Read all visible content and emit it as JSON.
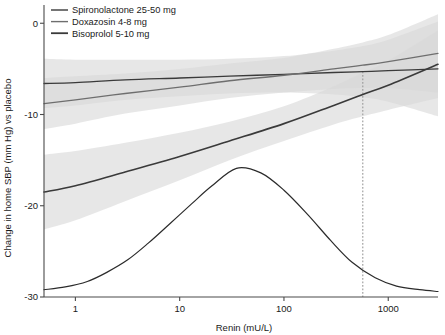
{
  "chart_data": {
    "type": "line",
    "title": "",
    "xlabel": "Renin (mU/L)",
    "ylabel": "Change in home SBP (mm Hg) vs placebo",
    "xscale": "log",
    "xlim": [
      0.5,
      3000
    ],
    "ylim": [
      -30,
      2
    ],
    "xticks": [
      1,
      10,
      100,
      1000
    ],
    "xticklabels": [
      "1",
      "10",
      "100",
      "1000"
    ],
    "yticks": [
      0,
      -10,
      -20,
      -30
    ],
    "yticklabels": [
      "0",
      "-10",
      "-20",
      "-30"
    ],
    "grid": false,
    "legend_position": "top-left",
    "series": [
      {
        "name": "Spironolactone 25-50 mg",
        "color": "#3a3a3a",
        "linewidth": 1.3,
        "x": [
          0.5,
          1,
          3,
          10,
          30,
          100,
          300,
          570,
          1000,
          3000
        ],
        "y": [
          -6.6,
          -6.5,
          -6.2,
          -6.0,
          -5.8,
          -5.6,
          -5.4,
          -5.3,
          -5.2,
          -5.0
        ],
        "band_lower": [
          -9.3,
          -9.0,
          -8.4,
          -8.0,
          -7.7,
          -7.6,
          -7.8,
          -8.1,
          -8.6,
          -10.2
        ],
        "band_upper": [
          -3.9,
          -4.0,
          -4.0,
          -4.0,
          -3.9,
          -3.6,
          -3.0,
          -2.5,
          -1.8,
          0.2
        ]
      },
      {
        "name": "Doxazosin 4-8 mg",
        "color": "#6e6e6e",
        "linewidth": 1.3,
        "x": [
          0.5,
          1,
          3,
          10,
          30,
          100,
          300,
          570,
          1000,
          3000
        ],
        "y": [
          -8.8,
          -8.4,
          -7.7,
          -7.0,
          -6.3,
          -5.7,
          -5.0,
          -4.6,
          -4.2,
          -3.3
        ],
        "band_lower": [
          -11.6,
          -11.0,
          -9.9,
          -9.0,
          -8.2,
          -7.6,
          -7.2,
          -7.1,
          -7.1,
          -7.6
        ],
        "band_upper": [
          -6.0,
          -5.8,
          -5.5,
          -5.0,
          -4.4,
          -3.8,
          -2.8,
          -2.1,
          -1.3,
          1.0
        ]
      },
      {
        "name": "Bisoprolol 5-10 mg",
        "color": "#3a3a3a",
        "linewidth": 1.6,
        "x": [
          0.5,
          1,
          3,
          10,
          30,
          100,
          300,
          570,
          1000,
          3000
        ],
        "y": [
          -18.5,
          -17.8,
          -16.3,
          -14.6,
          -12.9,
          -11.0,
          -9.0,
          -7.8,
          -6.8,
          -4.5
        ],
        "band_lower": [
          -22.6,
          -21.6,
          -19.5,
          -17.2,
          -15.0,
          -12.9,
          -11.1,
          -10.2,
          -9.5,
          -8.2
        ],
        "band_upper": [
          -14.4,
          -14.0,
          -13.1,
          -12.0,
          -10.8,
          -9.1,
          -6.9,
          -5.4,
          -4.1,
          -0.8
        ]
      }
    ],
    "density_curve": {
      "name": "renin-distribution",
      "color": "#2b2b2b",
      "linewidth": 1.2,
      "peak_x": 35,
      "peak_y": -15.9,
      "baseline_y": -29.2,
      "x": [
        0.5,
        0.8,
        1.3,
        2,
        3.2,
        5,
        8,
        13,
        20,
        35,
        60,
        100,
        170,
        280,
        450,
        750,
        1200,
        2000,
        3000
      ],
      "y": [
        -29.2,
        -28.9,
        -28.3,
        -27.3,
        -25.9,
        -24.1,
        -22.0,
        -19.8,
        -17.9,
        -15.9,
        -16.4,
        -18.3,
        -21.0,
        -23.8,
        -26.2,
        -27.9,
        -28.8,
        -29.2,
        -29.4
      ]
    },
    "reference_line": {
      "name": "crossing-point",
      "x": 570,
      "y_top": -5.3,
      "y_bottom": -30,
      "style": "dashed",
      "color": "#9a9a9a"
    },
    "band_color": "#d9d9d9",
    "band_opacity": 0.62
  },
  "legend": {
    "items": [
      {
        "label": "Spironolactone 25-50 mg",
        "color": "#3a3a3a",
        "width": 1.4
      },
      {
        "label": "Doxazosin 4-8 mg",
        "color": "#6e6e6e",
        "width": 1.4
      },
      {
        "label": "Bisoprolol 5-10 mg",
        "color": "#3a3a3a",
        "width": 1.8
      }
    ]
  },
  "axes": {
    "x_title": "Renin (mU/L)",
    "y_title": "Change in home SBP (mm Hg) vs placebo",
    "x_tick_labels": [
      "1",
      "10",
      "100",
      "1000"
    ],
    "y_tick_labels": [
      "0",
      "-10",
      "-20",
      "-30"
    ]
  }
}
